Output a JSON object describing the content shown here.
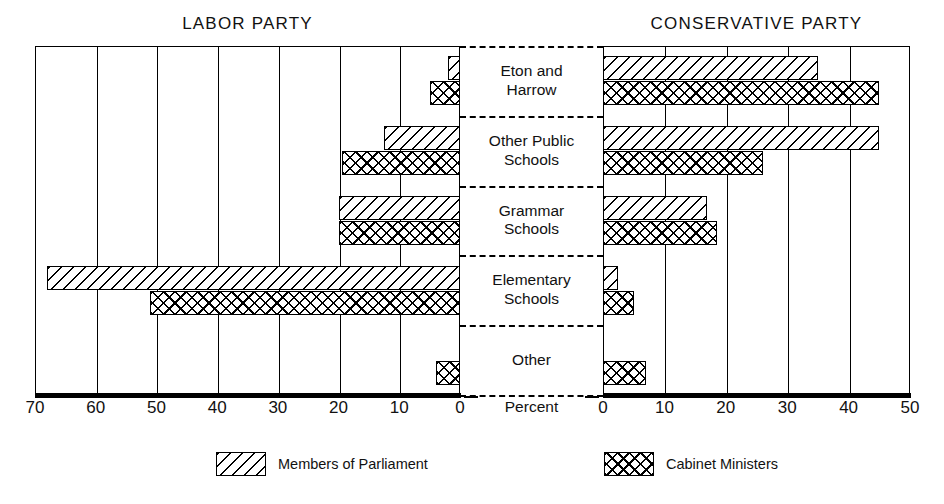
{
  "chart_data": {
    "type": "bar",
    "title": "",
    "orientation": "horizontal",
    "layout": "back-to-back pyramid (two opposing panels sharing category axis)",
    "grid": true,
    "legend_position": "bottom",
    "xlabel": "Percent",
    "ylabel": "",
    "panels": [
      {
        "name": "LABOR PARTY",
        "direction": "right-to-left",
        "xlim": [
          0,
          70
        ],
        "ticks": [
          70,
          60,
          50,
          40,
          30,
          20,
          10,
          0
        ],
        "series": [
          {
            "name": "Members of Parliament",
            "values": [
              2,
              12.5,
              20,
              68,
              0
            ]
          },
          {
            "name": "Cabinet Ministers",
            "values": [
              5,
              19.5,
              20,
              51,
              4
            ]
          }
        ]
      },
      {
        "name": "CONSERVATIVE PARTY",
        "direction": "left-to-right",
        "xlim": [
          0,
          50
        ],
        "ticks": [
          0,
          10,
          20,
          30,
          40,
          50
        ],
        "series": [
          {
            "name": "Members of Parliament",
            "values": [
              35,
              45,
              17,
              2.5,
              0
            ]
          },
          {
            "name": "Cabinet Ministers",
            "values": [
              45,
              26,
              18.5,
              5,
              7
            ]
          }
        ]
      }
    ],
    "categories": [
      "Eton and Harrow",
      "Other Public Schools",
      "Grammar Schools",
      "Elementary Schools",
      "Other"
    ]
  },
  "titles": {
    "left": "LABOR PARTY",
    "right": "CONSERVATIVE PARTY"
  },
  "categories": [
    {
      "line1": "Eton and",
      "line2": "Harrow"
    },
    {
      "line1": "Other Public",
      "line2": "Schools"
    },
    {
      "line1": "Grammar",
      "line2": "Schools"
    },
    {
      "line1": "Elementary",
      "line2": "Schools"
    },
    {
      "line1": "Other",
      "line2": ""
    }
  ],
  "axis": {
    "left_ticks": [
      "70",
      "60",
      "50",
      "40",
      "30",
      "20",
      "10",
      "0"
    ],
    "right_ticks": [
      "0",
      "10",
      "20",
      "30",
      "40",
      "50"
    ],
    "unit_label": "Percent"
  },
  "legend": [
    {
      "label": "Members of Parliament",
      "pattern": "diagonal-hatch"
    },
    {
      "label": "Cabinet Ministers",
      "pattern": "cross-hatch"
    }
  ],
  "colors": {
    "ink": "#000000",
    "paper": "#ffffff"
  }
}
